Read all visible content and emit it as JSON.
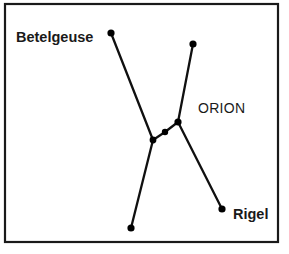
{
  "figure": {
    "name": "orion-constellation-diagram",
    "background_color": "#ffffff",
    "frame": {
      "stroke_color": "#1a1a1a",
      "stroke_width": 2.2,
      "x": 5,
      "y": 4,
      "width": 273,
      "height": 238
    },
    "line_color": "#101010",
    "star_color": "#000000"
  },
  "labels": {
    "betelgeuse": "Betelgeuse",
    "orion": "ORION",
    "rigel": "Rigel"
  },
  "caption_partial": "",
  "chart_data": {
    "type": "scatter",
    "title": "ORION",
    "xlabel": "",
    "ylabel": "",
    "xlim": [
      0,
      289
    ],
    "ylim": [
      254,
      0
    ],
    "grid": false,
    "legend": "none",
    "annotations": [
      {
        "text": "Betelgeuse",
        "x": 16,
        "y": 42,
        "weight": "bold",
        "size": 14.5
      },
      {
        "text": "ORION",
        "x": 198,
        "y": 113,
        "weight": "normal",
        "size": 14
      },
      {
        "text": "Rigel",
        "x": 233,
        "y": 219,
        "weight": "bold",
        "size": 14.5
      }
    ],
    "stars": [
      {
        "id": "betelgeuse",
        "name": "Betelgeuse",
        "x": 111,
        "y": 33,
        "r": 3.6
      },
      {
        "id": "bellatrix",
        "name": "",
        "x": 193,
        "y": 44,
        "r": 3.6
      },
      {
        "id": "belt-left",
        "name": "",
        "x": 153,
        "y": 140,
        "r": 3.4
      },
      {
        "id": "belt-middle",
        "name": "",
        "x": 165,
        "y": 132,
        "r": 3.2
      },
      {
        "id": "belt-right",
        "name": "",
        "x": 178,
        "y": 122,
        "r": 3.6
      },
      {
        "id": "saiph",
        "name": "",
        "x": 131,
        "y": 228,
        "r": 3.6
      },
      {
        "id": "rigel",
        "name": "Rigel",
        "x": 222,
        "y": 209,
        "r": 3.6
      }
    ],
    "segments": [
      {
        "from": "betelgeuse",
        "to": "belt-left"
      },
      {
        "from": "belt-left",
        "to": "belt-middle"
      },
      {
        "from": "belt-middle",
        "to": "belt-right"
      },
      {
        "from": "belt-right",
        "to": "bellatrix"
      },
      {
        "from": "belt-left",
        "to": "saiph"
      },
      {
        "from": "belt-right",
        "to": "rigel"
      }
    ]
  }
}
